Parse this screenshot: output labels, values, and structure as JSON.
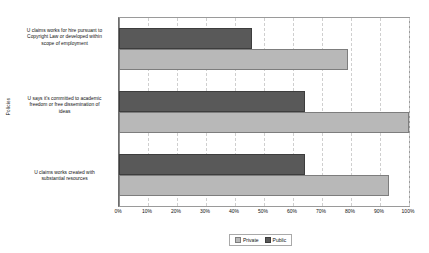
{
  "chart_data": {
    "type": "bar",
    "orientation": "horizontal",
    "title": "",
    "xlabel": "",
    "ylabel": "Policies",
    "xlim": [
      0,
      100
    ],
    "xtick_labels": [
      "0%",
      "10%",
      "20%",
      "30%",
      "40%",
      "50%",
      "60%",
      "70%",
      "80%",
      "90%",
      "100%"
    ],
    "xtick_values": [
      0,
      10,
      20,
      30,
      40,
      50,
      60,
      70,
      80,
      90,
      100
    ],
    "grid": true,
    "grid_axis": "x",
    "legend_position": "bottom",
    "categories": [
      "U claims works for hire pursuant to Copyright Law or developed within scope of employment",
      "U says it's committed to academic freedom or free dissemination of ideas",
      "U claims works created with substantial resources"
    ],
    "series": [
      {
        "name": "Private",
        "color": "#b8b8b8",
        "values": [
          79,
          100,
          93
        ]
      },
      {
        "name": "Public",
        "color": "#595959",
        "values": [
          46,
          64,
          64
        ]
      }
    ]
  },
  "axis": {
    "y_title": "Policies",
    "category_lines": [
      [
        "U claims works for hire pursuant to",
        "Copyright Law or developed within",
        "scope of employment"
      ],
      [
        "U says it's committed to academic",
        "freedom or free dissemination of",
        "ideas"
      ],
      [
        "U claims works created with",
        "substantial resources"
      ]
    ],
    "x_ticks": [
      "0%",
      "10%",
      "20%",
      "30%",
      "40%",
      "50%",
      "60%",
      "70%",
      "80%",
      "90%",
      "100%"
    ]
  },
  "legend": {
    "entries": [
      {
        "label": "Private",
        "color": "#b8b8b8"
      },
      {
        "label": "Public",
        "color": "#595959"
      }
    ]
  }
}
